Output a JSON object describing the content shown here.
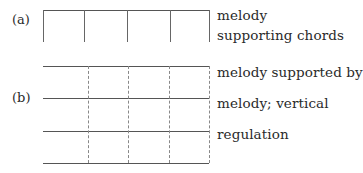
{
  "diagram": {
    "part_a": {
      "label": "(a)",
      "captions": [
        "melody",
        "supporting chords"
      ],
      "top_line": {
        "x1": 43,
        "x2": 209,
        "y": 10
      },
      "verticals": {
        "x": [
          43,
          84,
          127,
          170,
          209
        ],
        "y1": 10,
        "y2": 42,
        "style": "solid"
      }
    },
    "part_b": {
      "label": "(b)",
      "captions": [
        "melody supported by",
        "melody; vertical",
        "regulation"
      ],
      "horizontals": {
        "y": [
          66,
          98,
          131,
          163
        ],
        "x1": 43,
        "x2": 209,
        "style": "solid"
      },
      "verticals": {
        "x": [
          88,
          128,
          169,
          209
        ],
        "y1": 66,
        "y2": 163,
        "style": "dashed"
      }
    }
  }
}
